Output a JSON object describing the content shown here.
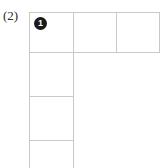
{
  "figure": {
    "label": "(2)",
    "background_color": "#ffffff",
    "grid_line_color": "#c9c9c9",
    "marker_color": "#1a1a1a",
    "marker_text_color": "#ffffff"
  },
  "markers": [
    {
      "id": "marker-1",
      "value": "1",
      "glyph": "filled-circle-number-1",
      "cell": "row-0-col-0"
    }
  ],
  "grid": {
    "shape": "L-shaped polyomino",
    "description": "Top row of three square cells plus a left column extending downward; bottom cell is clipped by the image edge.",
    "cells": [
      {
        "name": "row-0-col-0",
        "row": 0,
        "col": 0,
        "content": "1"
      },
      {
        "name": "row-0-col-1",
        "row": 0,
        "col": 1,
        "content": ""
      },
      {
        "name": "row-0-col-2",
        "row": 0,
        "col": 2,
        "content": ""
      },
      {
        "name": "row-1-col-0",
        "row": 1,
        "col": 0,
        "content": ""
      },
      {
        "name": "row-2-col-0",
        "row": 2,
        "col": 0,
        "content": ""
      },
      {
        "name": "row-3-col-0",
        "row": 3,
        "col": 0,
        "content": ""
      }
    ]
  }
}
